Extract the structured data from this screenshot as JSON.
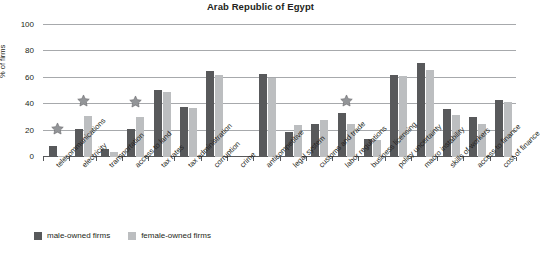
{
  "chart_data": {
    "type": "bar",
    "title": "Arab Republic of Egypt",
    "xlabel": "",
    "ylabel": "% of firms",
    "ylim": [
      0,
      100
    ],
    "yticks": [
      0,
      20,
      40,
      60,
      80,
      100
    ],
    "grid": true,
    "legend_position": "bottom-left",
    "categories": [
      "telecommunications",
      "electricity",
      "transportation",
      "access to land",
      "tax rates",
      "tax administration",
      "corruption",
      "crime",
      "anticompetitive",
      "legal system",
      "customs and trade",
      "labor regulations",
      "business licensing",
      "policy uncertainty",
      "macro instability",
      "skills of workers",
      "access to finance",
      "cost of finance"
    ],
    "series": [
      {
        "name": "male-owned firms",
        "color": "#58595b",
        "values": [
          8,
          21,
          6,
          21,
          51,
          38,
          65,
          0,
          63,
          19,
          25,
          33,
          14,
          62,
          71,
          36,
          30,
          43
        ]
      },
      {
        "name": "female-owned firms",
        "color": "#bcbec0",
        "values": [
          1,
          31,
          4,
          30,
          49,
          37,
          62,
          0,
          60,
          24,
          28,
          25,
          13,
          61,
          66,
          32,
          25,
          42
        ]
      }
    ],
    "annotations": {
      "marker": "star",
      "marker_color": "#808285",
      "description": "star denotes statistically significant difference",
      "points": [
        {
          "category": "telecommunications",
          "value": 17
        },
        {
          "category": "electricity",
          "value": 38
        },
        {
          "category": "access to land",
          "value": 37
        },
        {
          "category": "labor regulations",
          "value": 38
        }
      ]
    }
  },
  "legend": {
    "items": [
      {
        "label": "male-owned firms",
        "color": "#58595b"
      },
      {
        "label": "female-owned firms",
        "color": "#bcbec0"
      }
    ]
  }
}
